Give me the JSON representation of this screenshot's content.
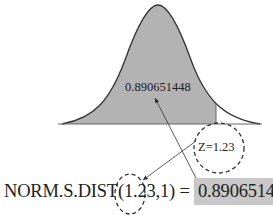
{
  "diagram": {
    "type": "normal-distribution-cdf",
    "area_label": "0.890651448",
    "z_label": "Z=1.23",
    "z_value": 1.23,
    "formula": {
      "function": "NORM.S.DIST(",
      "arg_z": "1.23",
      "separator": ",",
      "arg_cumulative": "1",
      "close": ")",
      "equals": " = ",
      "result": "0.890651448"
    },
    "colors": {
      "shade": "#b3b3b3",
      "result_bg": "#c8c8c8",
      "line": "#333333"
    }
  }
}
